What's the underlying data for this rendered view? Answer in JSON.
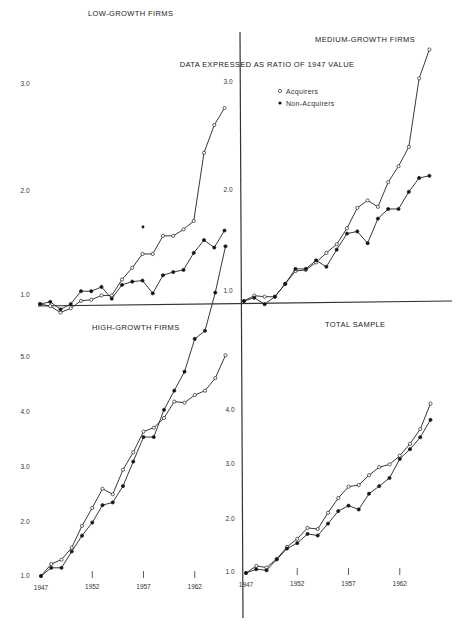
{
  "title": "DATA EXPRESSED AS RATIO OF 1947 VALUE",
  "legend": {
    "acquirers": "Acquirers",
    "non_acquirers": "Non-Acquirers"
  },
  "x_ticks": [
    "1947",
    "1952",
    "1957",
    "1962"
  ],
  "panels": {
    "low": {
      "title": "LOW-GROWTH FIRMS",
      "y_ticks": [
        "1.0",
        "2.0",
        "3.0"
      ]
    },
    "medium": {
      "title": "MEDIUM-GROWTH FIRMS",
      "y_ticks": [
        "1.0",
        "2.0",
        "3.0"
      ]
    },
    "high": {
      "title": "HIGH-GROWTH FIRMS",
      "y_ticks": [
        "1.0",
        "2.0",
        "3.0",
        "4.0",
        "5.0"
      ]
    },
    "total": {
      "title": "TOTAL SAMPLE",
      "y_ticks": [
        "1.0",
        "2.0",
        "3.0",
        "4.0"
      ]
    }
  },
  "chart_data": [
    {
      "type": "line",
      "title": "LOW-GROWTH FIRMS",
      "xlabel": "",
      "ylabel": "Ratio of 1947 value",
      "ylim": [
        0.9,
        3.0
      ],
      "x": [
        1947,
        1948,
        1949,
        1950,
        1951,
        1952,
        1953,
        1954,
        1955,
        1956,
        1957,
        1958,
        1959,
        1960,
        1961,
        1962,
        1963,
        1964,
        1965
      ],
      "series": [
        {
          "name": "Acquirers",
          "marker": "open",
          "values": [
            1.0,
            0.98,
            0.92,
            0.96,
            1.03,
            1.04,
            1.08,
            1.08,
            1.23,
            1.34,
            1.47,
            1.47,
            1.64,
            1.64,
            1.7,
            1.78,
            2.42,
            2.68,
            2.84
          ]
        },
        {
          "name": "Non-Acquirers",
          "marker": "filled",
          "values": [
            1.0,
            1.02,
            0.95,
            1.0,
            1.12,
            1.12,
            1.16,
            1.05,
            1.18,
            1.21,
            1.22,
            1.1,
            1.27,
            1.3,
            1.32,
            1.48,
            1.6,
            1.53,
            1.69
          ]
        }
      ]
    },
    {
      "type": "line",
      "title": "MEDIUM-GROWTH FIRMS",
      "xlabel": "",
      "ylabel": "Ratio of 1947 value",
      "ylim": [
        0.95,
        3.4
      ],
      "x": [
        1947,
        1948,
        1949,
        1950,
        1951,
        1952,
        1953,
        1954,
        1955,
        1956,
        1957,
        1958,
        1959,
        1960,
        1961,
        1962,
        1963,
        1964,
        1965
      ],
      "series": [
        {
          "name": "Acquirers",
          "marker": "open",
          "values": [
            1.0,
            1.05,
            1.04,
            1.04,
            1.16,
            1.28,
            1.29,
            1.36,
            1.45,
            1.53,
            1.68,
            1.87,
            1.94,
            1.88,
            2.11,
            2.26,
            2.44,
            3.08,
            3.35
          ]
        },
        {
          "name": "Non-Acquirers",
          "marker": "filled",
          "values": [
            1.0,
            1.03,
            0.97,
            1.04,
            1.16,
            1.3,
            1.3,
            1.38,
            1.32,
            1.48,
            1.63,
            1.65,
            1.54,
            1.77,
            1.86,
            1.86,
            2.02,
            2.15,
            2.17
          ]
        }
      ]
    },
    {
      "type": "line",
      "title": "HIGH-GROWTH FIRMS",
      "xlabel": "",
      "ylabel": "Ratio of 1947 value",
      "ylim": [
        1.0,
        7.6
      ],
      "x": [
        1947,
        1948,
        1949,
        1950,
        1951,
        1952,
        1953,
        1954,
        1955,
        1956,
        1957,
        1958,
        1959,
        1960,
        1961,
        1962,
        1963,
        1964,
        1965
      ],
      "series": [
        {
          "name": "Acquirers",
          "marker": "open",
          "values": [
            1.0,
            1.22,
            1.3,
            1.52,
            1.92,
            2.25,
            2.6,
            2.5,
            2.95,
            3.27,
            3.65,
            3.72,
            3.9,
            4.2,
            4.18,
            4.32,
            4.4,
            4.63,
            5.05
          ]
        },
        {
          "name": "Non-Acquirers",
          "marker": "filled",
          "values": [
            1.0,
            1.15,
            1.15,
            1.45,
            1.74,
            1.98,
            2.3,
            2.35,
            2.65,
            3.1,
            3.55,
            3.55,
            4.05,
            4.4,
            4.75,
            5.35,
            5.5,
            6.2,
            7.05
          ]
        }
      ]
    },
    {
      "type": "line",
      "title": "TOTAL SAMPLE",
      "xlabel": "",
      "ylabel": "Ratio of 1947 value",
      "ylim": [
        1.0,
        4.2
      ],
      "x": [
        1947,
        1948,
        1949,
        1950,
        1951,
        1952,
        1953,
        1954,
        1955,
        1956,
        1957,
        1958,
        1959,
        1960,
        1961,
        1962,
        1963,
        1964,
        1965
      ],
      "series": [
        {
          "name": "Acquirers",
          "marker": "open",
          "values": [
            1.0,
            1.13,
            1.1,
            1.26,
            1.48,
            1.63,
            1.83,
            1.81,
            2.11,
            2.38,
            2.59,
            2.62,
            2.8,
            2.95,
            3.0,
            3.16,
            3.38,
            3.65,
            4.12
          ]
        },
        {
          "name": "Non-Acquirers",
          "marker": "filled",
          "values": [
            1.0,
            1.07,
            1.05,
            1.25,
            1.45,
            1.55,
            1.72,
            1.69,
            1.91,
            2.14,
            2.24,
            2.17,
            2.46,
            2.6,
            2.75,
            3.1,
            3.28,
            3.5,
            3.82
          ]
        }
      ]
    }
  ]
}
